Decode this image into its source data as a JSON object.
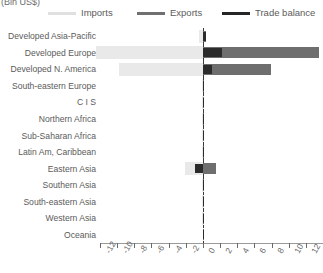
{
  "chart_data": {
    "type": "bar",
    "orientation": "horizontal",
    "title": "(Bln US$)",
    "xlabel": "",
    "ylabel": "",
    "xlim": [
      -12,
      14
    ],
    "xticks": [
      -12,
      -10,
      -8,
      -6,
      -4,
      -2,
      0,
      2,
      4,
      6,
      8,
      10,
      12,
      14
    ],
    "xtick_labels": [
      "-12",
      "-10",
      "-8",
      "-6",
      "-4",
      "-2",
      "0",
      "2",
      "4",
      "6",
      "8",
      "10",
      "12",
      "14"
    ],
    "grid": false,
    "legend_position": "top",
    "categories": [
      "Developed Asia-Pacific",
      "Developed Europe",
      "Developed N. America",
      "South-eastern Europe",
      "C I S",
      "Northern Africa",
      "Sub-Saharan Africa",
      "Latin Am, Caribbean",
      "Eastern Asia",
      "Southern Asia",
      "South-eastern Asia",
      "Western Asia",
      "Oceania"
    ],
    "series": [
      {
        "name": "Imports",
        "color": "#e9e9e9",
        "values": [
          -0.5,
          -12.5,
          -9.8,
          -0.1,
          -0.05,
          -0.05,
          -0.05,
          -0.1,
          -2.1,
          -0.05,
          -0.05,
          -0.05,
          -0.02
        ]
      },
      {
        "name": "Exports",
        "color": "#6e6e6e",
        "values": [
          0.35,
          13.5,
          7.9,
          0.1,
          0.05,
          0.05,
          0.05,
          0.1,
          1.5,
          0.1,
          0.1,
          0.05,
          0.02
        ]
      },
      {
        "name": "Trade balance",
        "color": "#2b2b2b",
        "values": [
          0.4,
          2.2,
          1.1,
          0.05,
          0.03,
          0.03,
          0.03,
          0.05,
          -0.9,
          0.05,
          0.05,
          0.03,
          0.01
        ]
      }
    ]
  },
  "legend": {
    "items": [
      {
        "label": "Imports",
        "color": "#e0e0e0"
      },
      {
        "label": "Exports",
        "color": "#707070"
      },
      {
        "label": "Trade balance",
        "color": "#262626"
      }
    ]
  }
}
